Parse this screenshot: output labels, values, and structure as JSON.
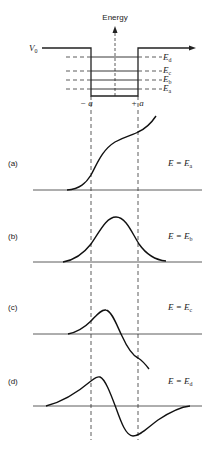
{
  "diagram": {
    "energy_axis_label": "Energy",
    "potential_label": "V",
    "potential_sub": "0",
    "left_edge_label": "− a",
    "right_edge_label": "+ a",
    "levels": [
      {
        "id": "d",
        "label": "E",
        "sub": "d"
      },
      {
        "id": "c",
        "label": "E",
        "sub": "c"
      },
      {
        "id": "b",
        "label": "E",
        "sub": "b"
      },
      {
        "id": "a",
        "label": "E",
        "sub": "a"
      }
    ],
    "panels": [
      {
        "tag": "(a)",
        "eq": "E = E",
        "sub": "a",
        "description": "monotonically increasing, non-normalizable"
      },
      {
        "tag": "(b)",
        "eq": "E = E",
        "sub": "b",
        "description": "symmetric ground-state bump"
      },
      {
        "tag": "(c)",
        "eq": "E = E",
        "sub": "c",
        "description": "crosses axis, diverges negative"
      },
      {
        "tag": "(d)",
        "eq": "E = E",
        "sub": "d",
        "description": "antisymmetric first excited state"
      }
    ]
  }
}
